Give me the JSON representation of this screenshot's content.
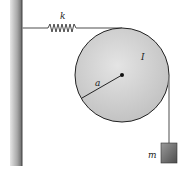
{
  "diagram": {
    "labels": {
      "spring_constant": "k",
      "moment_of_inertia": "I",
      "radius": "a",
      "mass": "m"
    },
    "components": [
      "wall",
      "spring",
      "pulley-disk",
      "string",
      "hanging-mass"
    ],
    "colors": {
      "wall": "#9a9a9a",
      "disk": "#cfcfcf",
      "outline": "#222222",
      "mass": "#6e6e6e"
    }
  }
}
